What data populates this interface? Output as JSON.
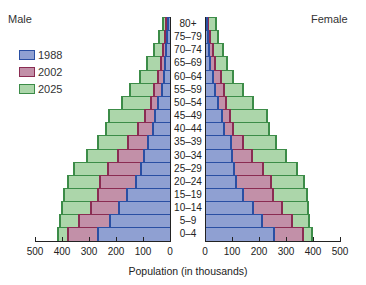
{
  "chart_data": {
    "type": "bar",
    "subtype": "population-pyramid",
    "title": "",
    "xlabel": "Population (in thousands)",
    "ylabel": "",
    "side_labels": {
      "left": "Male",
      "right": "Female"
    },
    "xlim": [
      0,
      500
    ],
    "x_ticks": [
      500,
      400,
      300,
      200,
      100,
      0,
      0,
      100,
      200,
      300,
      400,
      500
    ],
    "grid": false,
    "legend_position": "upper-left",
    "categories": [
      "80+",
      "75–79",
      "70–74",
      "65–69",
      "60–64",
      "55–59",
      "50–54",
      "45–49",
      "40–44",
      "35–39",
      "30–34",
      "25–29",
      "20–24",
      "15–19",
      "10–14",
      "5–9",
      "0–4"
    ],
    "series": [
      {
        "name": "1988",
        "color": "#8fa0d2",
        "edge": "#2a4fa3",
        "male": [
          11,
          15,
          19,
          22,
          26,
          33,
          48,
          59,
          67,
          85,
          100,
          111,
          130,
          163,
          193,
          226,
          270
        ],
        "female": [
          7,
          11,
          15,
          19,
          30,
          37,
          48,
          63,
          70,
          96,
          100,
          107,
          115,
          141,
          178,
          211,
          256
        ]
      },
      {
        "name": "2002",
        "color": "#c290a8",
        "edge": "#8a2c52",
        "male": [
          19,
          22,
          30,
          37,
          48,
          63,
          74,
          96,
          122,
          159,
          196,
          233,
          263,
          270,
          296,
          341,
          381
        ],
        "female": [
          11,
          19,
          30,
          37,
          59,
          70,
          78,
          93,
          104,
          141,
          174,
          215,
          244,
          252,
          285,
          322,
          363
        ]
      },
      {
        "name": "2025",
        "color": "#acd6aa",
        "edge": "#3c8c48",
        "male": [
          30,
          44,
          63,
          89,
          115,
          152,
          181,
          230,
          241,
          270,
          311,
          359,
          381,
          396,
          404,
          411,
          418
        ],
        "female": [
          41,
          48,
          67,
          81,
          104,
          141,
          178,
          230,
          237,
          263,
          300,
          341,
          367,
          378,
          381,
          385,
          396
        ]
      }
    ]
  },
  "labels": {
    "male": "Male",
    "female": "Female",
    "xlabel": "Population (in thousands)",
    "legend": [
      "1988",
      "2002",
      "2025"
    ],
    "ticks_left": [
      "500",
      "400",
      "300",
      "200",
      "100",
      "0"
    ],
    "ticks_right": [
      "0",
      "100",
      "200",
      "300",
      "400",
      "500"
    ]
  }
}
